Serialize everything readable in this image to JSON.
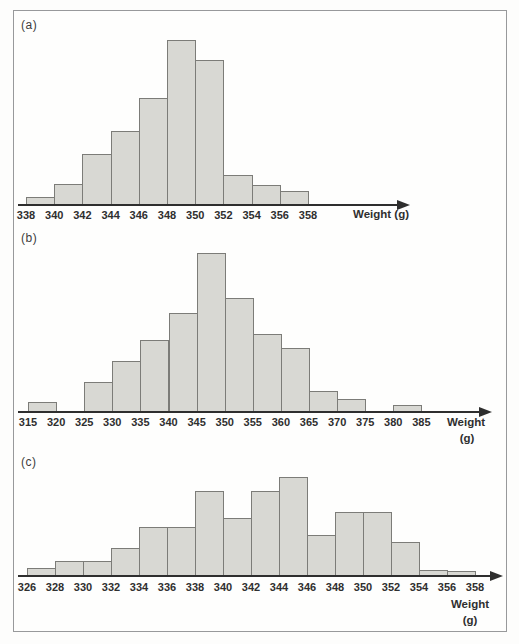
{
  "figure": {
    "background": "#fdfdfc",
    "frame_border_color": "#98999b",
    "bar_fill": "#d8d8d3",
    "bar_border": "#7c7c78",
    "axis_color": "#2e2e2e",
    "text_color": "#2f2f2f"
  },
  "chart_data": [
    {
      "type": "bar",
      "subtype": "histogram",
      "panel_label": "(a)",
      "xlabel": "Weight (g)",
      "xlabel_lines": [
        "Weight (g)"
      ],
      "bin_edges": [
        338,
        340,
        342,
        344,
        346,
        348,
        350,
        352,
        354,
        356,
        358
      ],
      "tick_labels": [
        "338",
        "340",
        "342",
        "344",
        "346",
        "348",
        "350",
        "352",
        "354",
        "356",
        "358"
      ],
      "heights_rel": [
        8,
        21,
        51,
        74,
        107,
        165,
        145,
        30,
        20,
        14
      ],
      "y_axis_shown": false,
      "grid": false,
      "legend": false,
      "note": "bar heights in relative units (no y-axis drawn in source)",
      "render_px": {
        "axis_y": 205,
        "axis_x_start": 18,
        "arrow_tip_x": 410,
        "bin_origin_x": 26,
        "bin_width": 28.2,
        "tick_label_y": 209
      }
    },
    {
      "type": "bar",
      "subtype": "histogram",
      "panel_label": "(b)",
      "xlabel": "Weight (g)",
      "xlabel_lines": [
        "Weight",
        "(g)"
      ],
      "bin_edges": [
        315,
        320,
        325,
        330,
        335,
        340,
        345,
        350,
        355,
        360,
        365,
        370,
        375,
        380,
        385
      ],
      "tick_labels": [
        "315",
        "320",
        "325",
        "330",
        "335",
        "340",
        "345",
        "350",
        "355",
        "360",
        "365",
        "370",
        "375",
        "380",
        "385"
      ],
      "heights_rel": [
        10,
        0,
        30,
        51,
        72,
        99,
        159,
        114,
        78,
        64,
        21,
        13,
        0,
        7
      ],
      "y_axis_shown": false,
      "grid": false,
      "legend": false,
      "note": "bar heights in relative units; bins 320-325 and 375-380 are empty",
      "render_px": {
        "axis_y": 412,
        "axis_x_start": 18,
        "arrow_tip_x": 492,
        "bin_origin_x": 28,
        "bin_width": 28.1,
        "tick_label_y": 416
      }
    },
    {
      "type": "bar",
      "subtype": "histogram",
      "panel_label": "(c)",
      "xlabel": "Weight (g)",
      "xlabel_lines": [
        "Weight",
        "(g)"
      ],
      "bin_edges": [
        326,
        328,
        330,
        332,
        334,
        336,
        338,
        340,
        342,
        344,
        346,
        348,
        350,
        352,
        354,
        356,
        358
      ],
      "tick_labels": [
        "326",
        "328",
        "330",
        "332",
        "334",
        "336",
        "338",
        "340",
        "342",
        "344",
        "346",
        "348",
        "350",
        "352",
        "354",
        "356",
        "358"
      ],
      "heights_rel": [
        8,
        15,
        15,
        28,
        49,
        49,
        85,
        58,
        85,
        99,
        41,
        64,
        64,
        34,
        6,
        5
      ],
      "y_axis_shown": false,
      "grid": false,
      "legend": false,
      "note": "bar heights in relative units (no y-axis drawn in source)",
      "render_px": {
        "axis_y": 576,
        "axis_x_start": 18,
        "arrow_tip_x": 503,
        "bin_origin_x": 27,
        "bin_width": 28,
        "tick_label_y": 581
      }
    }
  ]
}
